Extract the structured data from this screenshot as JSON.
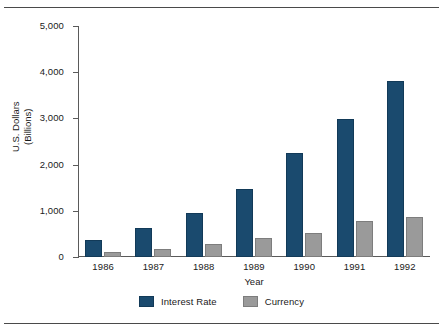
{
  "chart_data": {
    "type": "bar",
    "title": "",
    "subtitle": "",
    "xlabel": "Year",
    "ylabel": "U.S. Dollars (Billions)",
    "ylabel_line1": "U.S. Dollars",
    "ylabel_line2": "(Billions)",
    "categories": [
      "1986",
      "1987",
      "1988",
      "1989",
      "1990",
      "1991",
      "1992"
    ],
    "series": [
      {
        "name": "Interest Rate",
        "color": "#1a4a6e",
        "values": [
          370,
          620,
          960,
          1470,
          2250,
          2980,
          3800
        ]
      },
      {
        "name": "Currency",
        "color": "#9a9a9a",
        "values": [
          100,
          180,
          290,
          420,
          520,
          770,
          860
        ]
      }
    ],
    "ylim": [
      0,
      5000
    ],
    "yticks": [
      0,
      1000,
      2000,
      3000,
      4000,
      5000
    ],
    "ytick_labels": [
      "0",
      "1,000",
      "2,000",
      "3,000",
      "4,000",
      "5,000"
    ],
    "grid": false,
    "legend_position": "bottom"
  },
  "legend": {
    "items": [
      {
        "label": "Interest Rate",
        "color": "#1a4a6e"
      },
      {
        "label": "Currency",
        "color": "#9a9a9a"
      }
    ]
  },
  "colors": {
    "interest_rate": "#1a4a6e",
    "currency": "#9a9a9a",
    "axis": "#5a5a5a",
    "rule": "#4a4a4a",
    "text": "#1a1a1a",
    "background": "#ffffff"
  }
}
